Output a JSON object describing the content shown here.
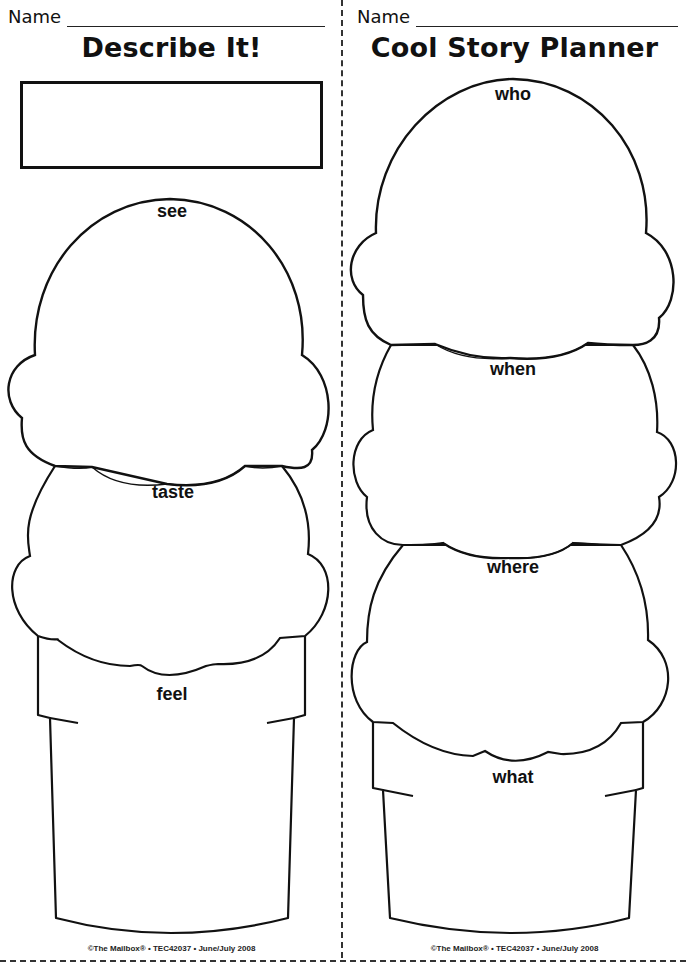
{
  "left": {
    "name_label": "Name",
    "title": "Describe It!",
    "topic_box": "",
    "scoops": [
      {
        "label": "see"
      },
      {
        "label": "taste"
      }
    ],
    "cone_label": "feel",
    "footer": "©The Mailbox® • TEC42037 • June/July 2008"
  },
  "right": {
    "name_label": "Name",
    "title": "Cool Story Planner",
    "scoops": [
      {
        "label": "who"
      },
      {
        "label": "when"
      },
      {
        "label": "where"
      }
    ],
    "cone_label": "what",
    "footer": "©The Mailbox® • TEC42037 • June/July 2008"
  },
  "colors": {
    "ink": "#111111",
    "paper": "#ffffff"
  }
}
